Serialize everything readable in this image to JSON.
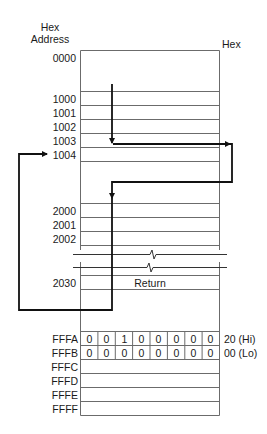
{
  "headers": {
    "address_line1": "Hex",
    "address_line2": "Address",
    "value": "Hex"
  },
  "addresses": {
    "a0000": "0000",
    "a1000": "1000",
    "a1001": "1001",
    "a1002": "1002",
    "a1003": "1003",
    "a1004": "1004",
    "a2000": "2000",
    "a2001": "2001",
    "a2002": "2002",
    "a2030": "2030",
    "aFFFA": "FFFA",
    "aFFFB": "FFFB",
    "aFFFC": "FFFC",
    "aFFFD": "FFFD",
    "aFFFE": "FFFE",
    "aFFFF": "FFFF"
  },
  "cells": {
    "return_label": "Return"
  },
  "vector": {
    "hi_bits": [
      "0",
      "0",
      "1",
      "0",
      "0",
      "0",
      "0",
      "0"
    ],
    "lo_bits": [
      "0",
      "0",
      "0",
      "0",
      "0",
      "0",
      "0",
      "0"
    ],
    "hi_value": "20 (Hi)",
    "lo_value": "00 (Lo)"
  },
  "colors": {
    "line": "#6b6b6b",
    "arrow": "#111111",
    "text": "#1a1a1a"
  }
}
